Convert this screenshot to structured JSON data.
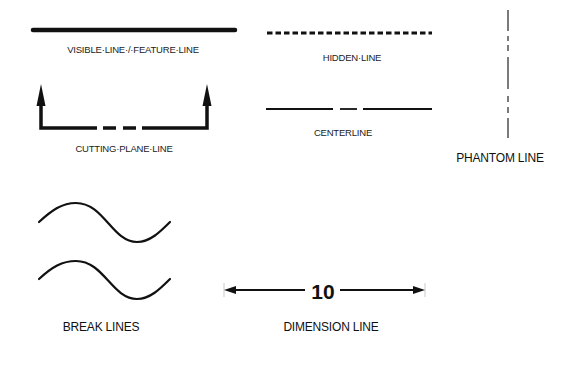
{
  "line_types": {
    "visible": {
      "label": "VISIBLE·LINE·/·FEATURE·LINE"
    },
    "hidden": {
      "label": "HIDDEN·LINE"
    },
    "centerline": {
      "label": "CENTERLINE"
    },
    "cutting_plane": {
      "label": "CUTTING·PLANE·LINE"
    },
    "phantom": {
      "label": "PHANTOM LINE"
    },
    "break": {
      "label": "BREAK LINES"
    },
    "dimension": {
      "label": "DIMENSION LINE",
      "value": "10"
    }
  },
  "colors": {
    "stroke": "#111111",
    "background": "#ffffff"
  }
}
